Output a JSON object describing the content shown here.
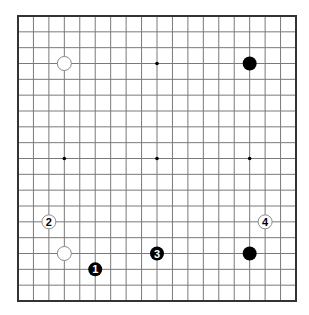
{
  "board": {
    "size": 19,
    "colors": {
      "background": "#ffffff",
      "grid_line": "#7a7a7a",
      "border": "#333333",
      "black_stone": "#000000",
      "white_stone_fill": "#ffffff",
      "white_stone_outline": "#8a8a8a"
    },
    "hoshi": [
      [
        3,
        3
      ],
      [
        9,
        3
      ],
      [
        15,
        3
      ],
      [
        3,
        9
      ],
      [
        9,
        9
      ],
      [
        15,
        9
      ],
      [
        3,
        15
      ],
      [
        9,
        15
      ],
      [
        15,
        15
      ]
    ],
    "stones": [
      {
        "col": 3,
        "row": 3,
        "color": "white",
        "label": ""
      },
      {
        "col": 15,
        "row": 3,
        "color": "black",
        "label": ""
      },
      {
        "col": 3,
        "row": 15,
        "color": "white",
        "label": ""
      },
      {
        "col": 15,
        "row": 15,
        "color": "black",
        "label": ""
      },
      {
        "col": 5,
        "row": 16,
        "color": "black",
        "label": "1"
      },
      {
        "col": 2,
        "row": 13,
        "color": "white",
        "label": "2"
      },
      {
        "col": 9,
        "row": 15,
        "color": "black",
        "label": "3"
      },
      {
        "col": 16,
        "row": 13,
        "color": "white",
        "label": "4"
      }
    ]
  }
}
